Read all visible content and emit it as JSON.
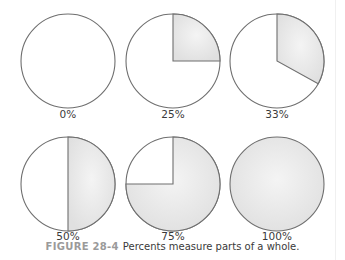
{
  "figure": {
    "number": "FIGURE 28-4",
    "caption": "Percents measure parts of a whole."
  },
  "colors": {
    "outline": "#6f6f6f",
    "fill_shaded": "#e6e6e6",
    "fill_blank": "#ffffff",
    "caption_number": "#9a9a9a",
    "text": "#3a3a3a"
  },
  "pies": [
    {
      "label": "0%",
      "percent": 0
    },
    {
      "label": "25%",
      "percent": 25
    },
    {
      "label": "33%",
      "percent": 33
    },
    {
      "label": "50%",
      "percent": 50
    },
    {
      "label": "75%",
      "percent": 75
    },
    {
      "label": "100%",
      "percent": 100
    }
  ],
  "chart_data": {
    "type": "pie",
    "title": "Percents measure parts of a whole.",
    "categories": [
      "0%",
      "25%",
      "33%",
      "50%",
      "75%",
      "100%"
    ],
    "values": [
      0,
      25,
      33,
      50,
      75,
      100
    ],
    "layout": "2 rows x 3 columns of circles, shaded wedge starting at 12 o'clock going clockwise"
  }
}
